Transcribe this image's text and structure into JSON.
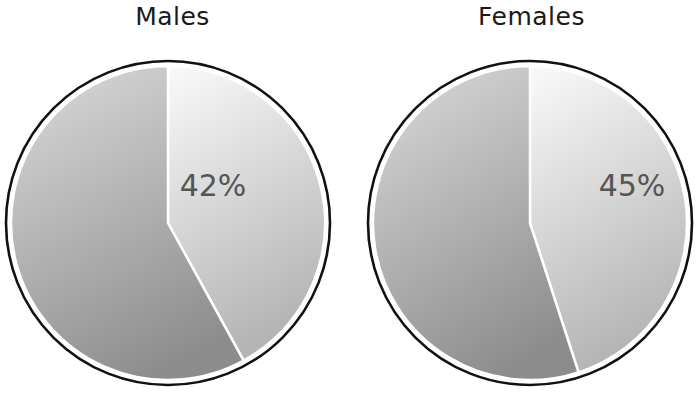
{
  "chart_data": [
    {
      "type": "pie",
      "title": "Males",
      "slices": [
        {
          "label": "highlighted",
          "value": 42,
          "display": "42%",
          "color_top": "#f7f7f7",
          "color_bottom": "#b9b9b9"
        },
        {
          "label": "remainder",
          "value": 58,
          "display": "",
          "color_top": "#d2d2d2",
          "color_bottom": "#8e8e8e"
        }
      ],
      "start_angle_deg": 0,
      "direction": "clockwise",
      "legend": "none"
    },
    {
      "type": "pie",
      "title": "Females",
      "slices": [
        {
          "label": "highlighted",
          "value": 45,
          "display": "45%",
          "color_top": "#f7f7f7",
          "color_bottom": "#b9b9b9"
        },
        {
          "label": "remainder",
          "value": 55,
          "display": "",
          "color_top": "#d2d2d2",
          "color_bottom": "#8e8e8e"
        }
      ],
      "start_angle_deg": 0,
      "direction": "clockwise",
      "legend": "none"
    }
  ],
  "charts": {
    "males": {
      "title": "Males",
      "label": "42%"
    },
    "females": {
      "title": "Females",
      "label": "45%"
    }
  },
  "colors": {
    "outline": "#111111",
    "divider": "#ffffff",
    "label": "#555555"
  }
}
